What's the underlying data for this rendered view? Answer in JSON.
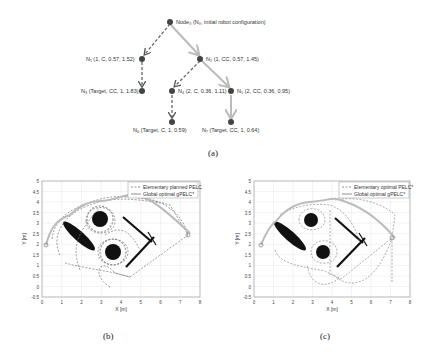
{
  "figure": {
    "tree": {
      "caption": "(a)",
      "nodes": [
        {
          "id": "N0",
          "label": "Node₀ (N₀, initial robot configuration)"
        },
        {
          "id": "N1",
          "label": "N₁ (1, C, 0.57, 1.52)"
        },
        {
          "id": "N2",
          "label": "N₂ (1, CC, 0.57, 1.45)"
        },
        {
          "id": "N3",
          "label": "N₃ (Target, CC, 1, 1.83)"
        },
        {
          "id": "N4",
          "label": "N₄ (2, C, 0.36, 1.11)"
        },
        {
          "id": "N5",
          "label": "N₅ (2, CC, 0.36, 0.95)"
        },
        {
          "id": "N6",
          "label": "N₆ (Target, C, 1, 0.59)"
        },
        {
          "id": "N7",
          "label": "N₇ (Target, CC, 1, 0.64)"
        }
      ],
      "edges": [
        {
          "from": "N0",
          "to": "N1",
          "style": "dashed"
        },
        {
          "from": "N0",
          "to": "N2",
          "style": "solid-optimal"
        },
        {
          "from": "N1",
          "to": "N3",
          "style": "dashed"
        },
        {
          "from": "N2",
          "to": "N4",
          "style": "dashed"
        },
        {
          "from": "N2",
          "to": "N5",
          "style": "solid-optimal"
        },
        {
          "from": "N4",
          "to": "N6",
          "style": "dashed"
        },
        {
          "from": "N5",
          "to": "N7",
          "style": "solid-optimal"
        }
      ]
    },
    "plot_b": {
      "caption": "(b)",
      "legend": [
        "Elementary planned PELC",
        "Global optimal gPELC*"
      ],
      "xlabel": "X [m]",
      "ylabel": "Y [m]",
      "xticks": [
        "0",
        "1",
        "2",
        "3",
        "4",
        "5",
        "6",
        "7",
        "8"
      ],
      "yticks": [
        "5",
        "4.5",
        "4",
        "3.5",
        "3",
        "2.5",
        "2",
        "1.5",
        "1",
        "0.5",
        "0",
        "-0.5"
      ]
    },
    "plot_c": {
      "caption": "(c)",
      "legend": [
        "Elementary optimal PELC*",
        "Global optimal gPELC*"
      ],
      "xlabel": "X [m]",
      "ylabel": "Y [m]",
      "xticks": [
        "0",
        "1",
        "2",
        "3",
        "4",
        "5",
        "6",
        "7",
        "8"
      ],
      "yticks": [
        "5",
        "4.5",
        "4",
        "3.5",
        "3",
        "2.5",
        "2",
        "1.5",
        "1",
        "0.5",
        "0",
        "-0.5"
      ]
    },
    "colors": {
      "dashed_edge": "#666666",
      "optimal_edge": "#bbbbbb",
      "node": "#444444",
      "obstacle": "#111111",
      "grid": "#e6e6e6"
    }
  }
}
